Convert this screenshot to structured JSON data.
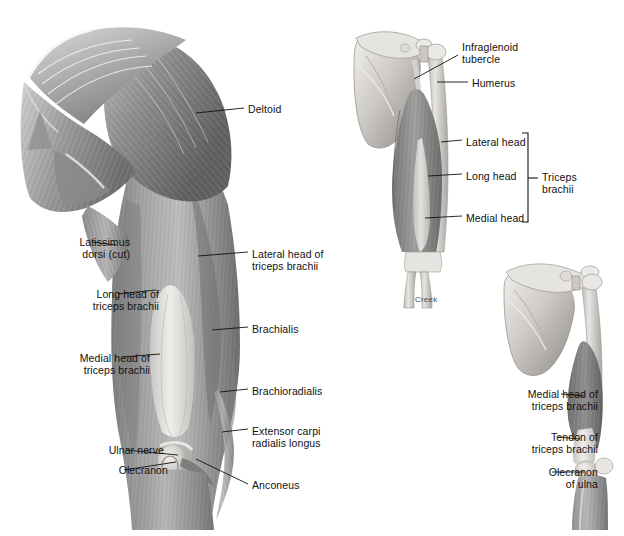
{
  "figure": {
    "title_visible": false,
    "signature": "Creek",
    "palette": {
      "background": "#ffffff",
      "label_text": "#111111",
      "leader_line": "#111111",
      "muscle_dark": "#6e6e6e",
      "muscle_mid": "#949494",
      "muscle_light": "#c9c9c9",
      "bone_light": "#e3e1dd",
      "bone_shadow": "#a8a5a0",
      "tendon": "#eceae6"
    }
  },
  "panels": [
    {
      "id": "posterior-superficial-arm",
      "name": "posterior-superficial-arm-view",
      "labels": [
        {
          "id": "deltoid",
          "text": "Deltoid",
          "align": "left",
          "x": 248,
          "y": 103,
          "leader": "M196,113 L244,108"
        },
        {
          "id": "latissimus-dorsi-cut",
          "text": "Latissimus\ndorsi (cut)",
          "align": "right",
          "x": 26,
          "y": 236,
          "leader": "M92,242 L116,245"
        },
        {
          "id": "lateral-head-triceps",
          "text": "Lateral head of\ntriceps brachii",
          "align": "left",
          "x": 252,
          "y": 248,
          "leader": "M198,256 L248,252"
        },
        {
          "id": "long-head-triceps",
          "text": "Long head of\ntriceps brachii",
          "align": "right",
          "x": 55,
          "y": 288,
          "leader": "M118,294 L156,290"
        },
        {
          "id": "brachialis",
          "text": "Brachialis",
          "align": "left",
          "x": 252,
          "y": 323,
          "leader": "M212,330 L248,327"
        },
        {
          "id": "medial-head-triceps",
          "text": "Medial head of\ntriceps brachii",
          "align": "right",
          "x": 46,
          "y": 352,
          "leader": "M123,357 L160,354"
        },
        {
          "id": "brachioradialis",
          "text": "Brachioradialis",
          "align": "left",
          "x": 252,
          "y": 385,
          "leader": "M220,392 L248,389"
        },
        {
          "id": "extensor-carpi-radialis-longus",
          "text": "Extensor carpi\nradialis longus",
          "align": "left",
          "x": 252,
          "y": 425,
          "leader": "M222,432 L248,429"
        },
        {
          "id": "ulnar-nerve",
          "text": "Ulnar nerve",
          "align": "right",
          "x": 60,
          "y": 444,
          "leader": "M126,450 L178,455"
        },
        {
          "id": "olecranon",
          "text": "Olecranon",
          "align": "right",
          "x": 64,
          "y": 464,
          "leader": "M124,470 L176,462"
        },
        {
          "id": "anconeus",
          "text": "Anconeus",
          "align": "left",
          "x": 252,
          "y": 479,
          "leader": "M196,459 L248,484"
        }
      ]
    },
    {
      "id": "triceps-deep-posterior",
      "name": "triceps-three-heads-view",
      "labels": [
        {
          "id": "infraglenoid-tubercle",
          "text": "Infraglenoid\ntubercle",
          "align": "left",
          "x": 462,
          "y": 41,
          "leader": "M414,79 L458,55"
        },
        {
          "id": "humerus",
          "text": "Humerus",
          "align": "left",
          "x": 472,
          "y": 77,
          "leader": "M437,82 L468,82"
        },
        {
          "id": "lateral-head",
          "text": "Lateral head",
          "align": "left",
          "x": 466,
          "y": 136,
          "leader": "M441,142 L462,140"
        },
        {
          "id": "long-head",
          "text": "Long head",
          "align": "left",
          "x": 466,
          "y": 170,
          "leader": "M428,176 L462,174"
        },
        {
          "id": "medial-head",
          "text": "Medial head",
          "align": "left",
          "x": 466,
          "y": 212,
          "leader": "M425,218 L462,216"
        }
      ],
      "bracket": {
        "id": "triceps-brachii-bracket",
        "text": "Triceps\nbrachii",
        "label_x": 542,
        "label_y": 171,
        "path": "M522,133 L528,133 L528,222 L522,222",
        "stem": "M528,178 L538,178"
      }
    },
    {
      "id": "triceps-medial-posterior",
      "name": "triceps-medial-head-tendon-view",
      "labels": [
        {
          "id": "medial-head-triceps-2",
          "text": "Medial head of\ntriceps brachii",
          "align": "right",
          "x": 494,
          "y": 388,
          "leader": "M561,394 L584,396"
        },
        {
          "id": "tendon-triceps",
          "text": "Tendon of\ntriceps brachii",
          "align": "right",
          "x": 494,
          "y": 431,
          "leader": "M558,437 L580,439"
        },
        {
          "id": "olecranon-of-ulna",
          "text": "Olecranon\nof ulna",
          "align": "right",
          "x": 494,
          "y": 466,
          "leader": "M552,472 L584,472"
        }
      ]
    }
  ]
}
